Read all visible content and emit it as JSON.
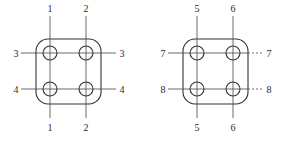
{
  "figures": [
    {
      "id": "left",
      "offset_x": 0,
      "labels": {
        "top_left": "1",
        "top_right": "2",
        "bottom_left": "1",
        "bottom_right": "2",
        "left_upper": "3",
        "right_upper": "3",
        "left_lower": "4",
        "right_lower": "4"
      }
    },
    {
      "id": "right",
      "offset_x": 147,
      "labels": {
        "top_left": "5",
        "top_right": "6",
        "bottom_left": "5",
        "bottom_right": "6",
        "left_upper": "7",
        "right_upper": "7",
        "left_lower": "8",
        "right_lower": "8"
      }
    }
  ],
  "style": {
    "stroke_color": "#333333",
    "background": "#ffffff"
  }
}
